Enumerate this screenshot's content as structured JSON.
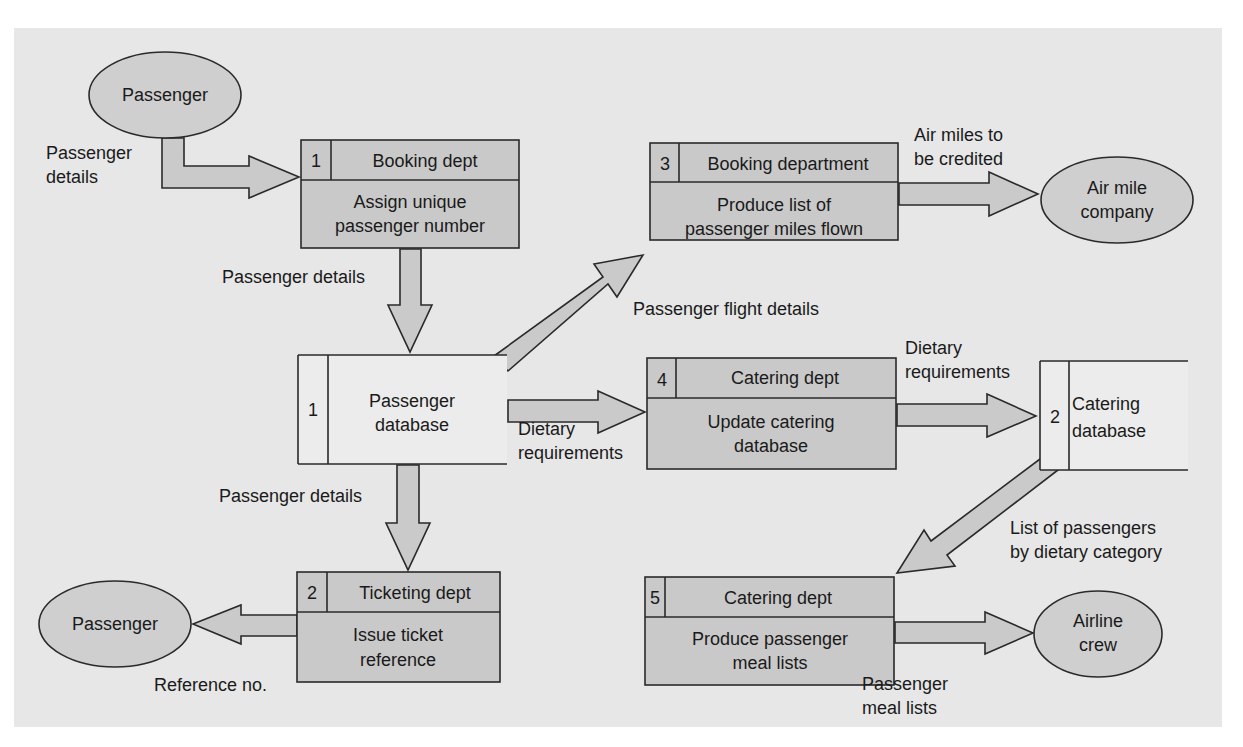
{
  "colors": {
    "panel": "#e7e7e7",
    "process_fill": "#c9c9c9",
    "entity_fill": "#cfcfcf",
    "arrow_fill": "#cacaca",
    "store_fill": "#ececec",
    "stroke": "#2a2a2a"
  },
  "entities": [
    {
      "id": "passenger_top",
      "label": "Passenger"
    },
    {
      "id": "air_mile",
      "lines": [
        "Air mile",
        "company"
      ]
    },
    {
      "id": "passenger_bottom",
      "label": "Passenger"
    },
    {
      "id": "airline_crew",
      "lines": [
        "Airline",
        "crew"
      ]
    }
  ],
  "processes": [
    {
      "number": "1",
      "dept": "Booking dept",
      "lines": [
        "Assign unique",
        "passenger number"
      ]
    },
    {
      "number": "3",
      "dept": "Booking department",
      "lines": [
        "Produce list of",
        "passenger miles flown"
      ]
    },
    {
      "number": "4",
      "dept": "Catering dept",
      "lines": [
        "Update catering",
        "database"
      ]
    },
    {
      "number": "2",
      "dept": "Ticketing dept",
      "lines": [
        "Issue ticket",
        "reference"
      ]
    },
    {
      "number": "5",
      "dept": "Catering dept",
      "lines": [
        "Produce passenger",
        "meal lists"
      ]
    }
  ],
  "data_stores": [
    {
      "number": "1",
      "lines": [
        "Passenger",
        "database"
      ]
    },
    {
      "number": "2",
      "lines": [
        "Catering",
        "database"
      ]
    }
  ],
  "flows": [
    {
      "id": "f1",
      "lines": [
        "Passenger",
        "details"
      ]
    },
    {
      "id": "f2",
      "lines": [
        "Passenger details"
      ]
    },
    {
      "id": "f3",
      "lines": [
        "Passenger flight details"
      ]
    },
    {
      "id": "f4",
      "lines": [
        "Air miles to",
        "be credited"
      ]
    },
    {
      "id": "f5",
      "lines": [
        "Dietary",
        "requirements"
      ]
    },
    {
      "id": "f6",
      "lines": [
        "Dietary",
        "requirements"
      ]
    },
    {
      "id": "f7",
      "lines": [
        "Passenger details"
      ]
    },
    {
      "id": "f8",
      "lines": [
        "Reference no."
      ]
    },
    {
      "id": "f9",
      "lines": [
        "List of passengers",
        "by dietary category"
      ]
    },
    {
      "id": "f10",
      "lines": [
        "Passenger",
        "meal lists"
      ]
    }
  ]
}
